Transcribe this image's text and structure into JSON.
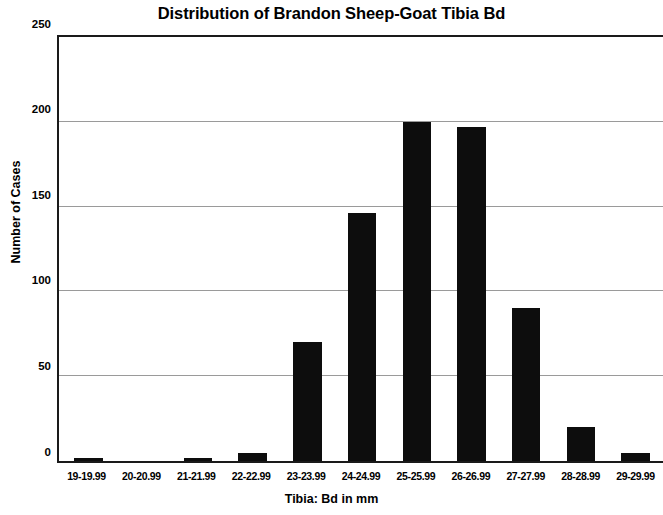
{
  "chart_data": {
    "type": "bar",
    "title": "Distribution of Brandon Sheep-Goat Tibia Bd",
    "xlabel": "Tibia: Bd in mm",
    "ylabel": "Number of Cases",
    "categories": [
      "19-19.99",
      "20-20.99",
      "21-21.99",
      "22-22.99",
      "23-23.99",
      "24-24.99",
      "25-25.99",
      "26-26.99",
      "27-27.99",
      "28-28.99",
      "29-29.99"
    ],
    "values": [
      1,
      0,
      1,
      5,
      70,
      146,
      200,
      197,
      90,
      20,
      5
    ],
    "ylim": [
      0,
      250
    ],
    "yticks": [
      0,
      50,
      100,
      150,
      200,
      250
    ],
    "ytick_labels": [
      "0",
      "50",
      "100",
      "150",
      "200",
      "250"
    ],
    "grid": true,
    "legend": false,
    "bar_color": "#0d0d0d",
    "gridline_color": "#9a9a9a",
    "axis_color": "#1a1a1a",
    "background": "#ffffff"
  }
}
